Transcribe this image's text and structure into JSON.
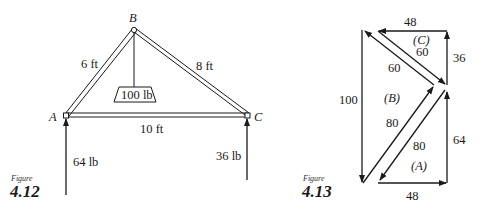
{
  "figure_4_12": {
    "caption_word": "Figure",
    "caption_number": "4.12",
    "nodes": {
      "a": "A",
      "b": "B",
      "c": "C"
    },
    "members": {
      "ab": "6 ft",
      "bc": "8 ft",
      "ac": "10 ft"
    },
    "load": "100 lb",
    "reactions": {
      "a": "64 lb",
      "c": "36 lb"
    }
  },
  "figure_4_13": {
    "caption_word": "Figure",
    "caption_number": "4.13",
    "regions": {
      "a": "(A)",
      "b": "(B)",
      "c": "(C)"
    },
    "force_labels": {
      "top": "48",
      "bottom": "48",
      "left": "100",
      "right_upper": "36",
      "right_lower": "64",
      "diag_c": "60",
      "diag_b_upper": "60",
      "diag_b_lower": "80",
      "diag_a": "80"
    }
  },
  "colors": {
    "ink": "#1a1a1a",
    "background": "#ffffff"
  }
}
